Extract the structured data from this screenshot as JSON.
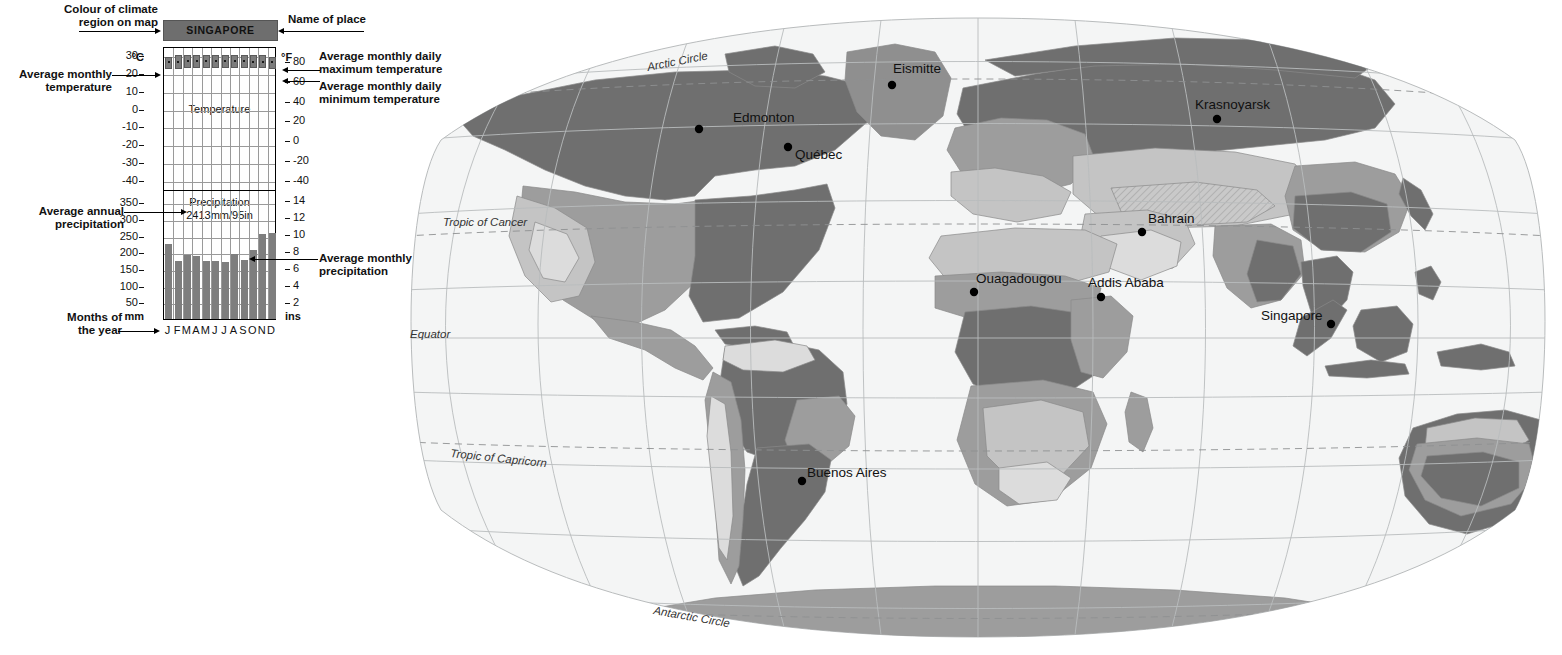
{
  "annotations": {
    "colour_of_climate_region": "Colour of climate\nregion on map",
    "name_of_place": "Name of place",
    "avg_monthly_temperature": "Average monthly\ntemperature",
    "avg_monthly_daily_max": "Average monthly daily\nmaximum temperature",
    "avg_monthly_daily_min": "Average monthly daily\nminimum temperature",
    "avg_annual_precipitation": "Average annual\nprecipitation",
    "avg_monthly_precipitation": "Average monthly\nprecipitation",
    "months_of_the_year": "Months of\nthe year"
  },
  "climate_graph": {
    "place": "SINGAPORE",
    "place_box_colour": "#6e6e6e",
    "temperature_pane_label": "Temperature",
    "precipitation_pane_label": "Precipitation",
    "annual_precipitation_text": "2413mm/95in",
    "annual_precipitation_mm": 2413,
    "annual_precipitation_in": 95,
    "axis_units": {
      "temp_left": "°C",
      "temp_right": "°F",
      "precip_left": "mm",
      "precip_right": "ins"
    },
    "temp_ticks_c": [
      30,
      20,
      10,
      0,
      -10,
      -20,
      -30,
      -40
    ],
    "temp_ticks_f": [
      80,
      60,
      40,
      20,
      0,
      -20,
      -40
    ],
    "precip_ticks_mm": [
      350,
      300,
      250,
      200,
      150,
      100,
      50
    ],
    "precip_ticks_in": [
      14,
      12,
      10,
      8,
      6,
      4,
      2
    ],
    "month_labels": [
      "J",
      "F",
      "M",
      "A",
      "M",
      "J",
      "J",
      "A",
      "S",
      "O",
      "N",
      "D"
    ]
  },
  "chart_data": {
    "type": "bar",
    "title": "SINGAPORE",
    "subtitle": "Climate graph: temperature range bars and monthly precipitation",
    "categories": [
      "J",
      "F",
      "M",
      "A",
      "M",
      "J",
      "J",
      "A",
      "S",
      "O",
      "N",
      "D"
    ],
    "xlabel": "Months of the year",
    "grid": true,
    "legend": "none",
    "series": [
      {
        "name": "Average monthly daily maximum temperature (°C)",
        "type": "range-bar-top",
        "values": [
          30,
          31,
          31,
          31,
          31,
          31,
          31,
          31,
          31,
          31,
          31,
          30
        ]
      },
      {
        "name": "Average monthly daily minimum temperature (°C)",
        "type": "range-bar-bottom",
        "values": [
          23,
          23,
          24,
          24,
          24,
          24,
          24,
          24,
          24,
          24,
          24,
          23
        ]
      },
      {
        "name": "Average monthly temperature (°C)",
        "type": "marker",
        "values": [
          27,
          27,
          28,
          28,
          28,
          28,
          28,
          28,
          28,
          27,
          27,
          27
        ]
      },
      {
        "name": "Average monthly precipitation (mm)",
        "type": "bar",
        "values": [
          225,
          173,
          193,
          188,
          173,
          173,
          170,
          196,
          178,
          208,
          254,
          257
        ]
      }
    ],
    "ylim_temperature_c": [
      -45,
      35
    ],
    "ylim_precipitation_mm": [
      0,
      390
    ],
    "ylabel_temperature": "°C",
    "ylabel_temperature_secondary": "°F",
    "ylabel_precipitation": "mm",
    "ylabel_precipitation_secondary": "ins"
  },
  "map": {
    "projection": "oval world projection",
    "cities": [
      {
        "name": "Edmonton",
        "label_x": 338,
        "label_y": 122,
        "dot_x": 304,
        "dot_y": 129
      },
      {
        "name": "Québec",
        "label_x": 400,
        "label_y": 159,
        "dot_x": 393,
        "dot_y": 147
      },
      {
        "name": "Eismitte",
        "label_x": 498,
        "label_y": 73,
        "dot_x": 497,
        "dot_y": 85
      },
      {
        "name": "Krasnoyarsk",
        "label_x": 800,
        "label_y": 109,
        "dot_x": 822,
        "dot_y": 119
      },
      {
        "name": "Bahrain",
        "label_x": 753,
        "label_y": 223,
        "dot_x": 747,
        "dot_y": 232
      },
      {
        "name": "Ouagadougou",
        "label_x": 581,
        "label_y": 283,
        "dot_x": 579,
        "dot_y": 292
      },
      {
        "name": "Addis Ababa",
        "label_x": 693,
        "label_y": 287,
        "dot_x": 706,
        "dot_y": 297
      },
      {
        "name": "Singapore",
        "label_x": 866,
        "label_y": 320,
        "dot_x": 936,
        "dot_y": 324
      },
      {
        "name": "Buenos Aires",
        "label_x": 412,
        "label_y": 477,
        "dot_x": 407,
        "dot_y": 481
      }
    ],
    "latitude_labels": [
      {
        "name": "Arctic Circle",
        "x": 253,
        "y": 71,
        "rotate": -11
      },
      {
        "name": "Tropic of Cancer",
        "x": 48,
        "y": 226,
        "rotate": 0
      },
      {
        "name": "Equator",
        "x": 15,
        "y": 338,
        "rotate": 0
      },
      {
        "name": "Tropic of Capricorn",
        "x": 55,
        "y": 457,
        "rotate": 6
      },
      {
        "name": "Antarctic Circle",
        "x": 258,
        "y": 614,
        "rotate": 10
      }
    ]
  },
  "palette": {
    "graph_bar": "#7e7e7e",
    "temp_box": "#7c7c7c",
    "title_box": "#6e6e6e",
    "map_dark": "#6f6f6f",
    "map_mid": "#9d9d9d",
    "map_light": "#c4c4c4",
    "map_pale": "#dcdcdc",
    "map_ocean": "#f4f5f5",
    "graticule": "#b9bcbd",
    "text": "#111111"
  }
}
